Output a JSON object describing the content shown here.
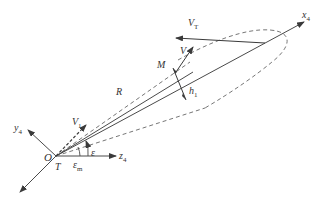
{
  "diagram": {
    "type": "geometry-vector-diagram",
    "labels": {
      "x_axis": "x",
      "x_axis_sub": "4",
      "y_axis": "y",
      "y_axis_sub": "4",
      "z_axis": "z",
      "z_axis_sub": "4",
      "origin_O": "O",
      "origin_T": "T",
      "target_velocity": "V",
      "target_velocity_sub": "T",
      "missile_velocity": "V",
      "missile_velocity_sub": "",
      "initial_velocity": "V",
      "initial_velocity_sub": "1",
      "point_M": "M",
      "range": "R",
      "offset": "h",
      "offset_sub": "1",
      "angle_epsilon": "ε",
      "angle_epsilon_m": "ε",
      "angle_epsilon_m_sub": "m"
    },
    "colors": {
      "line": "#4a4a4a",
      "dashed": "#666666",
      "text": "#333333",
      "background": "#ffffff"
    }
  }
}
